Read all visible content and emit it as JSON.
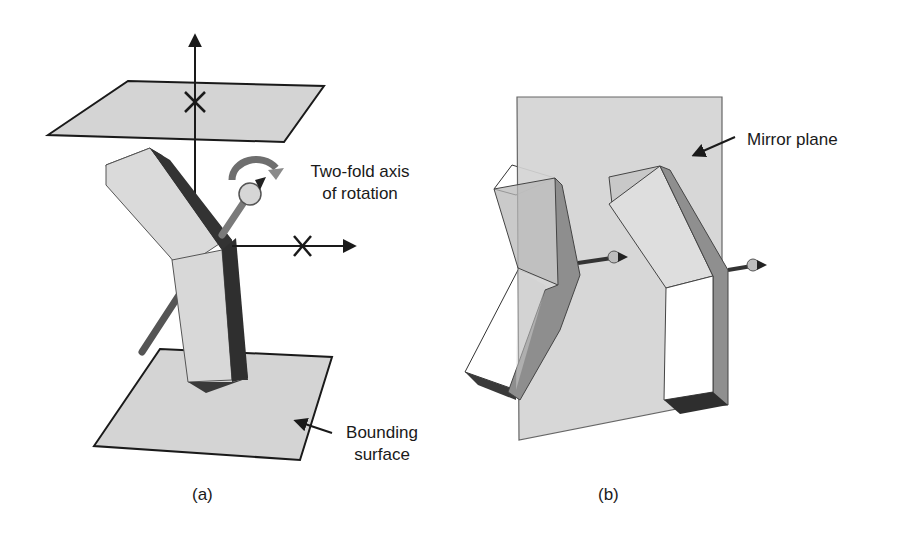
{
  "panel_a": {
    "caption": "(a)",
    "rotation_label_line1": "Two-fold axis",
    "rotation_label_line2": "of rotation",
    "surface_label_line1": "Bounding",
    "surface_label_line2": "surface",
    "icons": [
      "vertical-axis-arrow",
      "horizontal-axis-arrow",
      "cross-mark",
      "curved-rotation-arrow",
      "rod-with-arrowhead"
    ]
  },
  "panel_b": {
    "caption": "(b)",
    "mirror_label": "Mirror plane",
    "icons": [
      "rod-with-arrowhead",
      "pointer-arrow"
    ]
  },
  "colors": {
    "plane_fill": "#d4d4d4",
    "outline": "#1a1a1a",
    "bar_light": "#dcdcdc",
    "bar_dark": "#3a3a3a",
    "bar_mid": "#8f8f8f",
    "bar_white": "#ffffff",
    "rotation_arrow": "#6e6e6e"
  }
}
